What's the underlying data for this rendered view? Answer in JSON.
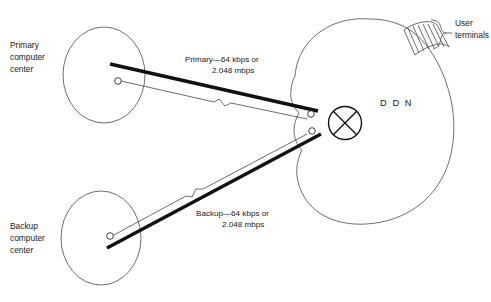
{
  "diagram": {
    "background_color": "#ffffff",
    "line_color": "#1a1a1a",
    "cloud_outline_color": "#4a4a4a"
  },
  "nodes": {
    "primary": {
      "label_line1": "Primary",
      "label_line2": "computer",
      "label_line3": "center"
    },
    "backup": {
      "label_line1": "Backup",
      "label_line2": "computer",
      "label_line3": "center"
    },
    "cloud": {
      "label": "D D N"
    },
    "terminals": {
      "label_line1": "User",
      "label_line2": "terminals"
    }
  },
  "links": {
    "primary": {
      "label_line1": "Primary—64 kbps or",
      "label_line2": "2.048 mbps"
    },
    "backup": {
      "label_line1": "Backup—64 kbps or",
      "label_line2": "2.048 mbps"
    }
  }
}
